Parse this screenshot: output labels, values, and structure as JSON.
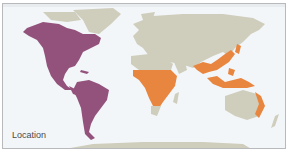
{
  "map": {
    "caption": "Location",
    "colors": {
      "ocean": "#f3f6f9",
      "land": "#cfcdbc",
      "region_americas": "#93527c",
      "region_old_world_tropics": "#e8853e",
      "border": "#b7b9bc"
    },
    "highlighted_regions": [
      {
        "name": "Americas",
        "color": "#93527c"
      },
      {
        "name": "Sub-Saharan Africa",
        "color": "#e8853e"
      },
      {
        "name": "South & Southeast Asia",
        "color": "#e8853e"
      },
      {
        "name": "Eastern Australia",
        "color": "#e8853e"
      }
    ]
  }
}
